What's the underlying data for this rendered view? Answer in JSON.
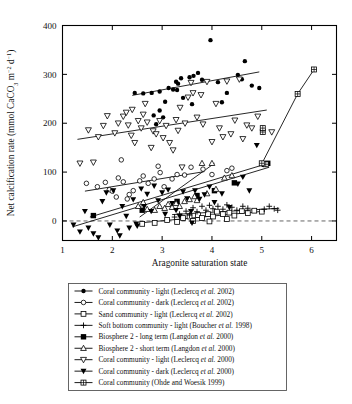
{
  "figure": {
    "background": "#ffffff",
    "line_color": "#000000"
  },
  "chart_data": {
    "type": "scatter",
    "title": "",
    "xlabel": "Aragonite saturation state",
    "ylabel": "Net calcification rate (mmol CaCO3 m-2 d-1)",
    "ylabel_parts": {
      "prefix": "Net calcification rate (mmol CaCO",
      "sub1": "3",
      "mid": " m",
      "sup1": "−2",
      "mid2": " d",
      "sup2": "−1",
      "suffix": ")"
    },
    "xlim": [
      1,
      6.5
    ],
    "ylim": [
      -40,
      400
    ],
    "xticks": [
      1,
      2,
      3,
      4,
      5,
      6
    ],
    "yticks": [
      0,
      100,
      200,
      300,
      400
    ],
    "xtick_labels": [
      "1",
      "2",
      "3",
      "4",
      "5",
      "6"
    ],
    "ytick_labels": [
      "0",
      "100",
      "200",
      "300",
      "400"
    ],
    "grid": false,
    "legend_position": "below-axes",
    "zero_reference_line": {
      "y": 0,
      "style": "dashed",
      "color": "#555555"
    },
    "series": [
      {
        "name": "Coral community - light (Leclercq et al. 2002)",
        "marker": "filled-circle",
        "points": [
          [
            2.45,
            262
          ],
          [
            2.62,
            261
          ],
          [
            2.79,
            262
          ],
          [
            2.95,
            265
          ],
          [
            3.13,
            272
          ],
          [
            3.22,
            269
          ],
          [
            3.28,
            285
          ],
          [
            3.32,
            281
          ],
          [
            3.3,
            268
          ],
          [
            3.38,
            292
          ],
          [
            3.06,
            244
          ],
          [
            3.42,
            252
          ],
          [
            3.55,
            294
          ],
          [
            3.63,
            297
          ],
          [
            3.72,
            303
          ],
          [
            3.8,
            289
          ],
          [
            3.97,
            370
          ],
          [
            4.12,
            284
          ],
          [
            4.3,
            262
          ],
          [
            4.52,
            299
          ],
          [
            4.6,
            290
          ],
          [
            4.66,
            327
          ],
          [
            4.8,
            277
          ],
          [
            4.95,
            272
          ],
          [
            2.95,
            226
          ],
          [
            2.88,
            198
          ],
          [
            2.83,
            216
          ],
          [
            3.02,
            212
          ],
          [
            3.6,
            239
          ],
          [
            4.2,
            243
          ]
        ]
      },
      {
        "name": "Coral community - dark (Leclercq et al. 2002)",
        "marker": "open-circle",
        "points": [
          [
            1.48,
            77
          ],
          [
            1.7,
            70
          ],
          [
            1.86,
            79
          ],
          [
            1.94,
            64
          ],
          [
            2.0,
            61
          ],
          [
            2.12,
            88
          ],
          [
            2.22,
            80
          ],
          [
            2.34,
            54
          ],
          [
            2.42,
            62
          ],
          [
            2.55,
            82
          ],
          [
            2.62,
            92
          ],
          [
            2.72,
            77
          ],
          [
            2.84,
            86
          ],
          [
            2.92,
            112
          ],
          [
            2.96,
            99
          ],
          [
            3.04,
            70
          ],
          [
            3.2,
            86
          ],
          [
            3.3,
            95
          ],
          [
            3.45,
            94
          ],
          [
            3.58,
            110
          ],
          [
            2.18,
            125
          ],
          [
            3.82,
            106
          ],
          [
            4.0,
            95
          ],
          [
            4.3,
            103
          ],
          [
            4.4,
            108
          ],
          [
            2.08,
            49
          ],
          [
            2.3,
            45
          ]
        ]
      },
      {
        "name": "Sand community - light (Leclercq et al. 2002)",
        "marker": "open-square",
        "points": [
          [
            2.6,
            -6
          ],
          [
            2.85,
            -4
          ],
          [
            3.1,
            2
          ],
          [
            3.3,
            -2
          ],
          [
            3.42,
            6
          ],
          [
            3.55,
            9
          ],
          [
            3.62,
            0
          ],
          [
            3.72,
            12
          ],
          [
            3.8,
            6
          ],
          [
            3.92,
            14
          ],
          [
            4.02,
            9
          ],
          [
            4.1,
            19
          ],
          [
            4.22,
            14
          ],
          [
            4.35,
            17
          ],
          [
            4.45,
            11
          ],
          [
            4.6,
            20
          ],
          [
            4.72,
            16
          ],
          [
            4.85,
            21
          ],
          [
            5.0,
            19
          ],
          [
            4.3,
            4
          ],
          [
            3.95,
            -1
          ]
        ]
      },
      {
        "name": "Soft bottom community - light (Boucher et al. 1998)",
        "marker": "plus",
        "points": [
          [
            3.35,
            14
          ],
          [
            3.48,
            20
          ],
          [
            3.55,
            12
          ],
          [
            3.62,
            27
          ],
          [
            3.7,
            19
          ],
          [
            3.8,
            30
          ],
          [
            3.88,
            22
          ],
          [
            3.95,
            32
          ],
          [
            4.02,
            25
          ],
          [
            4.12,
            30
          ],
          [
            4.22,
            24
          ],
          [
            4.3,
            33
          ],
          [
            4.4,
            28
          ],
          [
            4.5,
            22
          ],
          [
            4.62,
            30
          ],
          [
            4.72,
            26
          ],
          [
            5.05,
            24
          ],
          [
            5.15,
            30
          ],
          [
            5.25,
            25
          ],
          [
            5.32,
            22
          ],
          [
            3.25,
            8
          ]
        ]
      },
      {
        "name": "Biosphere 2 - long term (Langdon et al. 2000)",
        "marker": "filled-square",
        "points": [
          [
            1.62,
            11
          ],
          [
            2.6,
            22
          ],
          [
            3.3,
            40
          ],
          [
            3.7,
            52
          ],
          [
            4.05,
            62
          ],
          [
            4.45,
            78
          ],
          [
            5.05,
            116
          ],
          [
            5.12,
            118
          ]
        ]
      },
      {
        "name": "Biosphere 2 - short term (Langdon et al. 2000)",
        "marker": "open-triangle-up",
        "points": [
          [
            2.7,
            24
          ],
          [
            2.85,
            22
          ],
          [
            2.95,
            30
          ],
          [
            3.05,
            26
          ],
          [
            3.12,
            34
          ],
          [
            3.2,
            28
          ],
          [
            3.28,
            36
          ],
          [
            3.35,
            30
          ],
          [
            3.45,
            40
          ],
          [
            3.55,
            44
          ],
          [
            3.65,
            50
          ],
          [
            3.7,
            42
          ],
          [
            3.8,
            118
          ],
          [
            4.0,
            118
          ],
          [
            3.9,
            56
          ],
          [
            4.08,
            65
          ],
          [
            4.25,
            88
          ],
          [
            4.4,
            93
          ],
          [
            2.52,
            30
          ],
          [
            2.62,
            38
          ]
        ]
      },
      {
        "name": "Coral community - light (Leclercq et al. 2000)",
        "marker": "open-triangle-down",
        "points": [
          [
            1.35,
            118
          ],
          [
            1.62,
            120
          ],
          [
            1.52,
            186
          ],
          [
            1.72,
            172
          ],
          [
            1.82,
            195
          ],
          [
            1.9,
            215
          ],
          [
            2.05,
            180
          ],
          [
            2.12,
            200
          ],
          [
            2.22,
            214
          ],
          [
            2.28,
            222
          ],
          [
            2.32,
            196
          ],
          [
            2.38,
            175
          ],
          [
            2.45,
            160
          ],
          [
            2.52,
            205
          ],
          [
            2.58,
            190
          ],
          [
            2.62,
            218
          ],
          [
            2.7,
            202
          ],
          [
            2.78,
            150
          ],
          [
            2.82,
            184
          ],
          [
            2.88,
            178
          ],
          [
            2.95,
            205
          ],
          [
            3.02,
            170
          ],
          [
            3.08,
            195
          ],
          [
            3.15,
            160
          ],
          [
            3.22,
            145
          ],
          [
            3.28,
            207
          ],
          [
            3.32,
            185
          ],
          [
            3.4,
            110
          ],
          [
            3.46,
            200
          ],
          [
            3.52,
            253
          ],
          [
            3.58,
            283
          ],
          [
            3.62,
            262
          ],
          [
            3.7,
            212
          ],
          [
            3.78,
            258
          ],
          [
            3.82,
            198
          ],
          [
            3.9,
            285
          ],
          [
            4.0,
            162
          ],
          [
            4.08,
            240
          ],
          [
            4.15,
            190
          ],
          [
            4.22,
            172
          ],
          [
            4.3,
            286
          ],
          [
            4.38,
            178
          ],
          [
            4.46,
            206
          ],
          [
            4.55,
            290
          ],
          [
            4.62,
            168
          ],
          [
            4.7,
            196
          ],
          [
            4.8,
            190
          ],
          [
            4.92,
            214
          ],
          [
            5.2,
            182
          ],
          [
            2.66,
            240
          ],
          [
            2.4,
            228
          ],
          [
            3.36,
            232
          ]
        ]
      },
      {
        "name": "Coral community - dark (Leclercq et al. 2000)",
        "marker": "filled-triangle-down",
        "points": [
          [
            1.22,
            -8
          ],
          [
            1.35,
            -22
          ],
          [
            1.45,
            20
          ],
          [
            1.52,
            -14
          ],
          [
            1.62,
            -26
          ],
          [
            1.72,
            -34
          ],
          [
            1.8,
            40
          ],
          [
            1.88,
            58
          ],
          [
            1.95,
            -8
          ],
          [
            2.02,
            62
          ],
          [
            2.1,
            -20
          ],
          [
            2.2,
            30
          ],
          [
            2.28,
            10
          ],
          [
            2.34,
            -14
          ],
          [
            2.42,
            44
          ],
          [
            2.5,
            -10
          ],
          [
            2.58,
            66
          ],
          [
            2.64,
            30
          ],
          [
            2.7,
            55
          ],
          [
            2.78,
            20
          ],
          [
            2.84,
            72
          ],
          [
            2.92,
            42
          ],
          [
            3.0,
            58
          ],
          [
            3.06,
            14
          ],
          [
            3.12,
            64
          ],
          [
            3.2,
            36
          ],
          [
            3.28,
            22
          ],
          [
            3.35,
            10
          ],
          [
            3.42,
            60
          ],
          [
            3.5,
            46
          ],
          [
            3.58,
            20
          ],
          [
            3.66,
            62
          ],
          [
            3.75,
            45
          ],
          [
            3.85,
            54
          ],
          [
            3.95,
            70
          ],
          [
            4.05,
            38
          ],
          [
            4.2,
            56
          ],
          [
            4.35,
            28
          ],
          [
            4.52,
            76
          ],
          [
            4.62,
            90
          ],
          [
            4.75,
            62
          ],
          [
            4.9,
            155
          ],
          [
            2.48,
            -6
          ],
          [
            3.6,
            -4
          ],
          [
            2.15,
            -30
          ]
        ]
      },
      {
        "name": "Coral community (Ohde and Woesik 1999)",
        "marker": "crossed-square",
        "points": [
          [
            5.08,
            116
          ],
          [
            5.02,
            182
          ],
          [
            5.02,
            190
          ],
          [
            5.72,
            260
          ],
          [
            6.05,
            310
          ],
          [
            5.0,
            118
          ]
        ]
      }
    ],
    "fit_lines": [
      {
        "series": "coral-light-2002",
        "x1": 2.4,
        "y1": 257,
        "x2": 4.95,
        "y2": 305
      },
      {
        "series": "coral-light-2000",
        "x1": 1.3,
        "y1": 167,
        "x2": 5.1,
        "y2": 227
      },
      {
        "series": "coral-dark-2002",
        "x1": 1.45,
        "y1": 61,
        "x2": 3.85,
        "y2": 101
      },
      {
        "series": "coral-dark-2000",
        "x1": 1.2,
        "y1": -12,
        "x2": 5.15,
        "y2": 110
      },
      {
        "series": "biosphere2-long",
        "x1": 1.55,
        "y1": 8,
        "x2": 5.1,
        "y2": 117
      },
      {
        "series": "biosphere2-short",
        "x1": 2.55,
        "y1": 8,
        "x2": 4.05,
        "y2": 118
      },
      {
        "series": "sand-light",
        "x1": 2.55,
        "y1": -4,
        "x2": 5.05,
        "y2": 20
      },
      {
        "series": "soft-bottom",
        "x1": 3.2,
        "y1": 13,
        "x2": 5.35,
        "y2": 26
      },
      {
        "series": "ohde-woesik",
        "x1": 5.0,
        "y1": 117,
        "x2": 5.72,
        "y2": 260,
        "x3": 6.05,
        "y3": 310
      }
    ]
  },
  "legend": {
    "items": [
      {
        "marker": "filled-circle",
        "text_a": "Coral community - light (Leclercq ",
        "ital": "et al.",
        "text_b": " 2002)"
      },
      {
        "marker": "open-circle",
        "text_a": "Coral community - dark (Leclercq ",
        "ital": "et al.",
        "text_b": " 2002)"
      },
      {
        "marker": "open-square",
        "text_a": "Sand community - light (Leclercq ",
        "ital": "et al.",
        "text_b": " 2002)"
      },
      {
        "marker": "plus",
        "text_a": "Soft bottom community - light (Boucher ",
        "ital": "et al.",
        "text_b": " 1998)"
      },
      {
        "marker": "filled-square",
        "text_a": "Biosphere 2 - long term (Langdon ",
        "ital": "et al.",
        "text_b": " 2000)"
      },
      {
        "marker": "open-triangle-up",
        "text_a": "Biosphere 2 - short term (Langdon ",
        "ital": "et al.",
        "text_b": " 2000)"
      },
      {
        "marker": "open-triangle-down",
        "text_a": "Coral community - light (Leclercq ",
        "ital": "et al.",
        "text_b": " 2000)"
      },
      {
        "marker": "filled-triangle-down",
        "text_a": "Coral community - dark (Leclercq ",
        "ital": "et al.",
        "text_b": " 2000)"
      },
      {
        "marker": "crossed-square",
        "text_a": "Coral community (Ohde and Woesik 1999)",
        "ital": "",
        "text_b": ""
      }
    ]
  }
}
